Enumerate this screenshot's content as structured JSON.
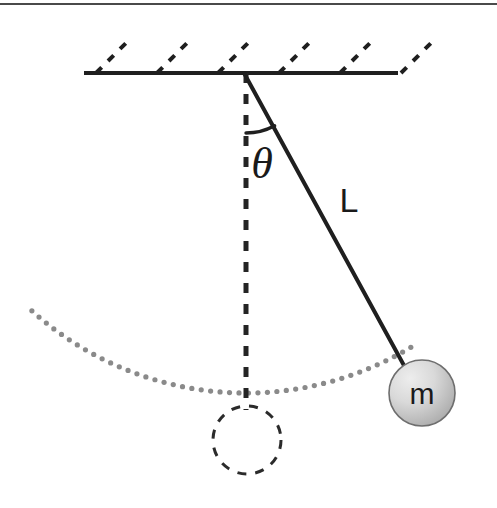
{
  "figure": {
    "title_visible": false,
    "type": "simple-pendulum-diagram",
    "width": 497,
    "height": 508,
    "background_color": "#ffffff"
  },
  "labels": {
    "angle": "θ",
    "length": "L",
    "mass": "m"
  },
  "colors": {
    "ink": "#1a1a1a",
    "stroke": "#222222",
    "rule": "#4a4a4a",
    "arc_dots": "#8a8a8a",
    "bob_fill_light": "#e2e2e2",
    "bob_fill_dark": "#a8a8a8",
    "bob_stroke": "#6e6e6e",
    "dashed_circle": "#2b2b2b"
  },
  "geometry": {
    "top_rule": {
      "x1": 0,
      "y1": 4,
      "x2": 497,
      "y2": 4,
      "width": 2
    },
    "ceiling_bar": {
      "x1": 84,
      "y1": 73,
      "x2": 398,
      "y2": 73,
      "width": 4
    },
    "pivot": {
      "x": 244,
      "y": 73
    },
    "string": {
      "x1": 244,
      "y1": 73,
      "x2": 407,
      "y2": 371,
      "width": 4
    },
    "vertical_dashed": {
      "x1": 246,
      "y1": 73,
      "x2": 246,
      "y2": 410,
      "width": 5,
      "dash": "10 11"
    },
    "angle_arc": {
      "cx": 246,
      "cy": 73,
      "radius": 60,
      "start_deg": 0,
      "end_deg": 28.5
    },
    "bob": {
      "cx": 422,
      "cy": 393,
      "r": 33
    },
    "equilibrium_circle": {
      "cx": 247,
      "cy": 440,
      "r": 34,
      "dash": "9 9",
      "width": 3
    },
    "swing_arc": {
      "cx": 246,
      "cy": 73,
      "radius": 320,
      "dot_radius": 2.6,
      "dot_count": 44,
      "start_deg": -42,
      "end_deg": 31
    },
    "hatching": {
      "count": 6,
      "start_x": 96,
      "spacing": 61,
      "dx": 34,
      "dy": -34,
      "dash": "8 9",
      "width": 4
    },
    "label_positions": {
      "theta": {
        "x": 262,
        "y": 178
      },
      "length": {
        "x": 349,
        "y": 212
      },
      "mass": {
        "x": 422,
        "y": 404
      }
    },
    "label_sizes": {
      "theta": 44,
      "length": 34,
      "mass": 30
    },
    "angle_from_vertical_deg": 28.5
  }
}
